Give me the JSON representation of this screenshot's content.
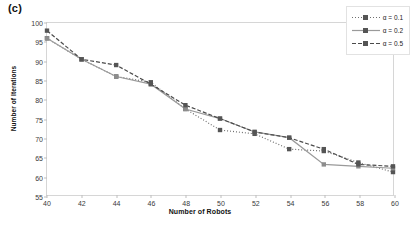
{
  "panel": {
    "label": "(c)"
  },
  "legend": {
    "position": "top-right",
    "entries": [
      {
        "label": "α = 0.1",
        "dash": "1,2",
        "color": "#6f6f6f",
        "width": 1.2
      },
      {
        "label": "α = 0.2",
        "dash": "",
        "color": "#9a9a9a",
        "width": 1.2
      },
      {
        "label": "α = 0.5",
        "dash": "4,2",
        "color": "#4a4a4a",
        "width": 1.2
      }
    ]
  },
  "chart_data": {
    "type": "line",
    "title": "",
    "xlabel": "Number of Robots",
    "ylabel": "Number of Iterations",
    "x": [
      40,
      42,
      44,
      46,
      48,
      50,
      52,
      54,
      56,
      58,
      60
    ],
    "xlim": [
      40,
      60
    ],
    "ylim": [
      55,
      100
    ],
    "xticks": [
      40,
      42,
      44,
      46,
      48,
      50,
      52,
      54,
      56,
      58,
      60
    ],
    "yticks": [
      55,
      60,
      65,
      70,
      75,
      80,
      85,
      90,
      95,
      100
    ],
    "grid": false,
    "marker": "square",
    "series": [
      {
        "name": "α = 0.1",
        "values": [
          96.0,
          90.5,
          86.0,
          84.5,
          77.5,
          72.0,
          71.0,
          67.0,
          66.5,
          63.5,
          61.0
        ]
      },
      {
        "name": "α = 0.2",
        "values": [
          96.0,
          90.5,
          86.0,
          84.0,
          77.5,
          75.0,
          71.5,
          70.0,
          63.0,
          62.5,
          62.0
        ]
      },
      {
        "name": "α = 0.5",
        "values": [
          98.0,
          90.5,
          89.0,
          84.0,
          78.5,
          75.0,
          71.5,
          70.0,
          67.0,
          63.0,
          62.5
        ]
      }
    ]
  }
}
